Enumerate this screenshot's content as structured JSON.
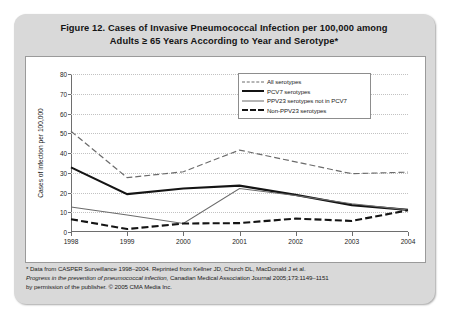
{
  "figure": {
    "title_line1": "Figure 12. Cases of Invasive Pneumococcal Infection per 100,000 among",
    "title_line2": "Adults ≥ 65 Years According to Year and Serotype*"
  },
  "footnotes": {
    "line1": "* Data from CASPER Surveillance 1998–2004. Reprinted from Kellner JD, Church DL, MacDonald J et al.",
    "line2_italic": "Progress in the prevention of pneumococcal infection,",
    "line2_rest": " Canadian Medical Association Journal 2005;173:1149–1151",
    "line3": "by permission of the publisher. © 2005 CMA Media Inc."
  },
  "chart_data": {
    "type": "line",
    "title": "Cases of Invasive Pneumococcal Infection per 100,000 among Adults ≥ 65 Years According to Year and Serotype",
    "xlabel": "",
    "ylabel": "Cases of infection per 100,000",
    "categories": [
      "1998",
      "1999",
      "2000",
      "2001",
      "2002",
      "2003",
      "2004"
    ],
    "x": [
      1998,
      1999,
      2000,
      2001,
      2002,
      2003,
      2004
    ],
    "ylim": [
      0,
      80
    ],
    "yticks": [
      0,
      10,
      20,
      30,
      40,
      50,
      60,
      70,
      80
    ],
    "grid": true,
    "legend_position": "top-right",
    "series": [
      {
        "name": "All serotypes",
        "style": "dashed",
        "color": "#6b6b6b",
        "width": 1.2,
        "values": [
          51,
          27.5,
          30.5,
          41.5,
          35.5,
          29.5,
          30.3
        ]
      },
      {
        "name": "PCV7 serotypes",
        "style": "solid",
        "color": "#141414",
        "width": 2.1,
        "values": [
          32.7,
          19.2,
          22,
          23.5,
          18.8,
          13.6,
          11.2
        ]
      },
      {
        "name": "PPV23 serotypes not in PCV7",
        "style": "solid",
        "color": "#6b6b6b",
        "width": 1.1,
        "values": [
          12.7,
          8.6,
          4.3,
          22,
          18.5,
          14.3,
          11.2
        ]
      },
      {
        "name": "Non-PPV23 serotypes",
        "style": "dashed",
        "color": "#141414",
        "width": 2.1,
        "values": [
          6.5,
          1.5,
          4.3,
          4.5,
          6.8,
          5.6,
          11
        ]
      }
    ]
  }
}
